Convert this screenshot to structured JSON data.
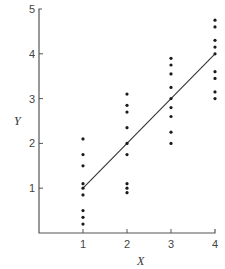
{
  "chart_data": {
    "type": "scatter",
    "title": "",
    "xlabel": "X",
    "ylabel": "Y",
    "xlim": [
      0,
      4
    ],
    "ylim": [
      0,
      5
    ],
    "x_ticks": [
      1,
      2,
      3,
      4
    ],
    "y_ticks": [
      1,
      2,
      3,
      4,
      5
    ],
    "grid": false,
    "legend": null,
    "series": [
      {
        "name": "observations",
        "points": [
          {
            "x": 1,
            "y": 2.1
          },
          {
            "x": 1,
            "y": 1.75
          },
          {
            "x": 1,
            "y": 1.5
          },
          {
            "x": 1,
            "y": 1.1
          },
          {
            "x": 1,
            "y": 1.0
          },
          {
            "x": 1,
            "y": 0.85
          },
          {
            "x": 1,
            "y": 0.5
          },
          {
            "x": 1,
            "y": 0.35
          },
          {
            "x": 1,
            "y": 0.2
          },
          {
            "x": 2,
            "y": 3.1
          },
          {
            "x": 2,
            "y": 2.85
          },
          {
            "x": 2,
            "y": 2.7
          },
          {
            "x": 2,
            "y": 2.35
          },
          {
            "x": 2,
            "y": 2.0
          },
          {
            "x": 2,
            "y": 1.75
          },
          {
            "x": 2,
            "y": 1.1
          },
          {
            "x": 2,
            "y": 1.0
          },
          {
            "x": 2,
            "y": 0.9
          },
          {
            "x": 3,
            "y": 3.9
          },
          {
            "x": 3,
            "y": 3.75
          },
          {
            "x": 3,
            "y": 3.55
          },
          {
            "x": 3,
            "y": 3.25
          },
          {
            "x": 3,
            "y": 3.0
          },
          {
            "x": 3,
            "y": 2.8
          },
          {
            "x": 3,
            "y": 2.6
          },
          {
            "x": 3,
            "y": 2.25
          },
          {
            "x": 3,
            "y": 2.0
          },
          {
            "x": 4,
            "y": 4.75
          },
          {
            "x": 4,
            "y": 4.6
          },
          {
            "x": 4,
            "y": 4.3
          },
          {
            "x": 4,
            "y": 4.15
          },
          {
            "x": 4,
            "y": 4.0
          },
          {
            "x": 4,
            "y": 3.6
          },
          {
            "x": 4,
            "y": 3.45
          },
          {
            "x": 4,
            "y": 3.15
          },
          {
            "x": 4,
            "y": 3.0
          }
        ]
      },
      {
        "name": "fitted line",
        "type": "line",
        "points": [
          {
            "x": 1,
            "y": 1
          },
          {
            "x": 4,
            "y": 4
          }
        ]
      }
    ]
  },
  "layout": {
    "origin_px": [
      39,
      233
    ],
    "px_per_x": 44,
    "px_per_y": 44.8
  }
}
